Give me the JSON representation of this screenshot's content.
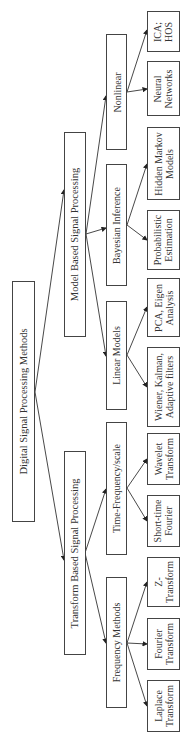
{
  "diagram": {
    "title": "Digital Signal Processing Methods",
    "orientation": "rotated-90-counterclockwise",
    "root": {
      "label": "Digital Signal Processing Methods"
    },
    "branches": [
      {
        "label": "Model Based Signal Processing",
        "children": [
          {
            "label": "Nonlinear",
            "children": [
              {
                "label": "ICA;\nHOS"
              },
              {
                "label": "Neural\nNetworks"
              }
            ]
          },
          {
            "label": "Bayesian Inference",
            "children": [
              {
                "label": "Hidden Markov\nModels"
              },
              {
                "label": "Probabilistic\nEstimation"
              }
            ]
          },
          {
            "label": "Linear Models",
            "children": [
              {
                "label": "PCA, Eigen\nAnalysis"
              },
              {
                "label": "Wiener, Kalman,\nAdaptive filters"
              }
            ]
          }
        ]
      },
      {
        "label": "Transform Based Signal Processing",
        "children": [
          {
            "label": "Time-Frequency/scale",
            "children": [
              {
                "label": "Wavelet\nTransform"
              },
              {
                "label": "Short-time\nFourier"
              }
            ]
          },
          {
            "label": "Frequency Methods",
            "children": [
              {
                "label": "Z-\nTransform"
              },
              {
                "label": "Fourier\nTransform"
              },
              {
                "label": "Laplace\nTransform"
              }
            ]
          }
        ]
      }
    ],
    "colors": {
      "line": "#333333",
      "box_border": "#444444",
      "background": "#ffffff"
    }
  }
}
